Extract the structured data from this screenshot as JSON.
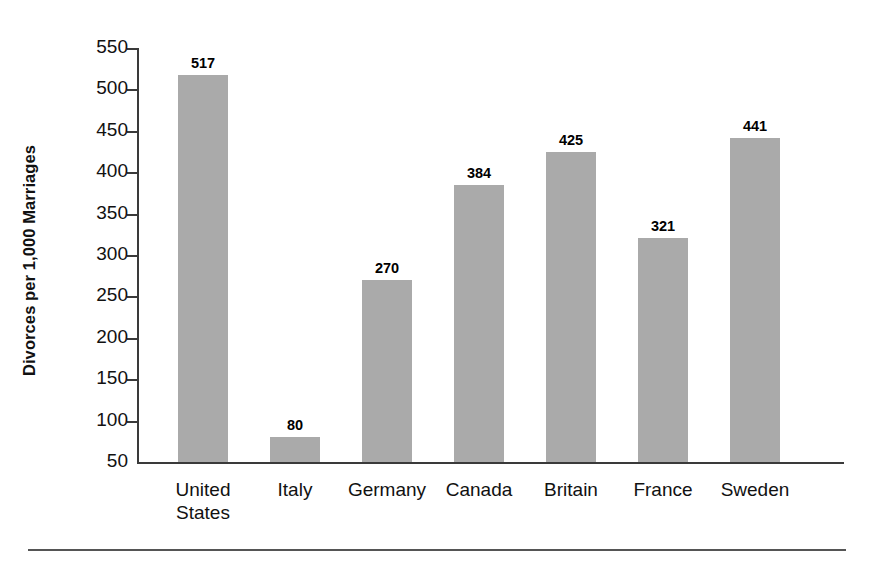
{
  "chart_data": {
    "type": "bar",
    "title": "",
    "subtitle": "",
    "xlabel": "",
    "ylabel": "Divorces per 1,000 Marriages",
    "categories": [
      "United States",
      "Italy",
      "Germany",
      "Canada",
      "Britain",
      "France",
      "Sweden"
    ],
    "category_lines": [
      [
        "United",
        "States"
      ],
      [
        "Italy"
      ],
      [
        "Germany"
      ],
      [
        "Canada"
      ],
      [
        "Britain"
      ],
      [
        "France"
      ],
      [
        "Sweden"
      ]
    ],
    "values": [
      517,
      80,
      270,
      384,
      425,
      321,
      441
    ],
    "value_labels": [
      "517",
      "80",
      "270",
      "384",
      "425",
      "321",
      "441"
    ],
    "ylim": [
      50,
      550
    ],
    "ytick_values": [
      550,
      500,
      450,
      400,
      350,
      300,
      250,
      200,
      150,
      100,
      50
    ],
    "ytick_labels": [
      "550",
      "500",
      "450",
      "400",
      "350",
      "300",
      "250",
      "200",
      "150",
      "100",
      "50"
    ],
    "grid": false,
    "legend": false,
    "legend_position": "none",
    "bar_color": "#aaaaaa",
    "axis_color": "#3a3a3a",
    "text_color": "#111111",
    "background": "#ffffff"
  }
}
